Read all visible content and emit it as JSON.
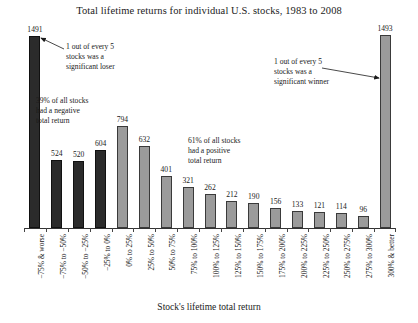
{
  "chart_data": {
    "type": "bar",
    "title": "Total lifetime returns for individual U.S. stocks, 1983 to 2008",
    "xlabel": "Stock's lifetime total return",
    "ylabel": "",
    "ylim": [
      0,
      1550
    ],
    "grid": false,
    "legend": "none",
    "categories": [
      "−75% & worse",
      "−75% to −50%",
      "−50% to −25%",
      "−25% to 0%",
      "0% to 25%",
      "25% to 50%",
      "50% to 75%",
      "75% to 100%",
      "100% to 125%",
      "125% to 150%",
      "150% to 175%",
      "175% to 200%",
      "200% to 225%",
      "225% to 250%",
      "250% to 275%",
      "275% to 300%",
      "300% & better"
    ],
    "values": [
      1491,
      524,
      520,
      604,
      794,
      632,
      401,
      321,
      262,
      212,
      190,
      156,
      133,
      121,
      114,
      96,
      1493
    ],
    "bar_colors": [
      "#2b2b2b",
      "#2b2b2b",
      "#2b2b2b",
      "#2b2b2b",
      "#9b9b9b",
      "#9b9b9b",
      "#9b9b9b",
      "#9b9b9b",
      "#9b9b9b",
      "#9b9b9b",
      "#9b9b9b",
      "#9b9b9b",
      "#9b9b9b",
      "#9b9b9b",
      "#9b9b9b",
      "#9b9b9b",
      "#9b9b9b"
    ],
    "negative_group_count": 4,
    "annotations": [
      "1 out of every 5\nstocks was a\nsignificant loser",
      "39% of all stocks\nhad a negative\ntotal return",
      "61% of all stocks\nhad a positive\ntotal return",
      "1 out of every 5\nstocks was a\nsignificant winner"
    ]
  },
  "annotations": {
    "loser": "1 out of every 5\nstocks was a\nsignificant loser",
    "negative": "39% of all stocks\nhad a negative\ntotal return",
    "positive": "61% of all stocks\nhad a positive\ntotal return",
    "winner": "1 out of every 5\nstocks was a\nsignificant winner"
  },
  "colors": {
    "negative_bar": "#2b2b2b",
    "positive_bar": "#9b9b9b",
    "axis": "#333333",
    "text": "#1a1a1a",
    "background": "#ffffff"
  }
}
